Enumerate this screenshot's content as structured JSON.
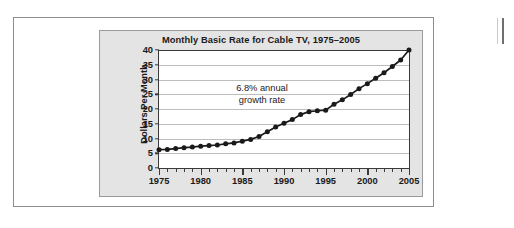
{
  "figure": {
    "panel_background": "#e4e4e4",
    "plot_background": "#ffffff",
    "frame_border": "#8d8d8d"
  },
  "annotation": {
    "line1": "6.8% annual",
    "line2": "growth rate"
  },
  "chart_data": {
    "type": "line",
    "title": "Monthly Basic Rate for Cable TV, 1975–2005",
    "xlabel": "",
    "ylabel": "Dollars Per Month",
    "xlim": [
      1975,
      2005
    ],
    "ylim": [
      0,
      40
    ],
    "ytick_labels": [
      "0",
      "5",
      "10",
      "15",
      "20",
      "25",
      "30",
      "35",
      "40"
    ],
    "yticks": [
      0,
      5,
      10,
      15,
      20,
      25,
      30,
      35,
      40
    ],
    "xtick_labels": [
      "1975",
      "1980",
      "1985",
      "1990",
      "1995",
      "2000",
      "2005"
    ],
    "xticks": [
      1975,
      1980,
      1985,
      1990,
      1995,
      2000,
      2005
    ],
    "x_minor_step": 1,
    "grid": "horizontal",
    "legend": "none",
    "marker": "filled-circle",
    "line_color": "#1a1a1a",
    "marker_color": "#1a1a1a",
    "annotations": [
      {
        "text": "6.8% annual growth rate",
        "x": 1988,
        "y": 27
      }
    ],
    "x": [
      1975,
      1976,
      1977,
      1978,
      1979,
      1980,
      1981,
      1982,
      1983,
      1984,
      1985,
      1986,
      1987,
      1988,
      1989,
      1990,
      1991,
      1992,
      1993,
      1994,
      1995,
      1996,
      1997,
      1998,
      1999,
      2000,
      2001,
      2002,
      2003,
      2004,
      2005
    ],
    "values": [
      6.2,
      6.3,
      6.6,
      6.9,
      7.1,
      7.4,
      7.6,
      7.8,
      8.2,
      8.5,
      9.1,
      9.7,
      10.7,
      12.3,
      13.9,
      15.2,
      16.4,
      18.1,
      19.1,
      19.4,
      19.6,
      21.6,
      23.1,
      24.9,
      26.9,
      28.6,
      30.4,
      32.3,
      34.4,
      36.6,
      40.0
    ],
    "values_label": "Dollars Per Month"
  }
}
